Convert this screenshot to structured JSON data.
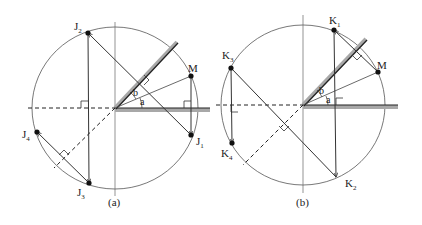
{
  "figure": {
    "panels": [
      {
        "id": "a",
        "caption": "(a)",
        "points": {
          "J1": {
            "label": "J",
            "sub": "1"
          },
          "J2": {
            "label": "J",
            "sub": "2"
          },
          "J3": {
            "label": "J",
            "sub": "3"
          },
          "J4": {
            "label": "J",
            "sub": "4"
          },
          "M": {
            "label": "M"
          }
        },
        "angles": {
          "a": "a",
          "b": "b"
        }
      },
      {
        "id": "b",
        "caption": "(b)",
        "points": {
          "K1": {
            "label": "K",
            "sub": "1"
          },
          "K2": {
            "label": "K",
            "sub": "2"
          },
          "K3": {
            "label": "K",
            "sub": "3"
          },
          "K4": {
            "label": "K",
            "sub": "4"
          },
          "M": {
            "label": "M"
          }
        },
        "angles": {
          "a": "a",
          "b": "b"
        }
      }
    ],
    "colors": {
      "line": "#333333",
      "mirror": "#9a9a9a",
      "circle": "#555555"
    }
  }
}
